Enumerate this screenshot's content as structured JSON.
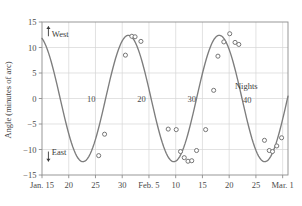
{
  "chart_data": {
    "type": "line",
    "title": "",
    "subtitle": "",
    "xlabel": "",
    "ylabel": "Angle (minutes of arc)",
    "ylim": [
      -15,
      15
    ],
    "ytick_values": [
      15,
      10,
      5,
      0,
      -5,
      -10,
      -15
    ],
    "ytick_labels": [
      "15",
      "10",
      "5",
      "0",
      "−5",
      "−10",
      "−15"
    ],
    "grid": true,
    "grid_color": "#d6d6d6",
    "legend": "none",
    "xlim_days": [
      0,
      46
    ],
    "xtick_days": [
      0,
      5,
      10,
      15,
      20,
      25,
      30,
      35,
      40,
      45
    ],
    "xtick_labels": [
      "Jan. 15",
      "20",
      "25",
      "30",
      "Feb. 5",
      "10",
      "15",
      "20",
      "25",
      "Mar. 1"
    ],
    "annotations": [
      {
        "text": "West",
        "x_day": 1.2,
        "y": 12.4,
        "arrow": "up"
      },
      {
        "text": "East",
        "x_day": 1.2,
        "y": -10.6,
        "arrow": "down"
      },
      {
        "text": "Nights",
        "x_day": 38.2,
        "y": 1.9,
        "arrow": "none"
      },
      {
        "text": "10",
        "x_day": 9.2,
        "y": -0.6,
        "arrow": "none"
      },
      {
        "text": "20",
        "x_day": 18.6,
        "y": -0.6,
        "arrow": "none"
      },
      {
        "text": "30",
        "x_day": 28.0,
        "y": -0.6,
        "arrow": "none"
      },
      {
        "text": "40",
        "x_day": 38.4,
        "y": -0.9,
        "arrow": "none"
      }
    ],
    "series": [
      {
        "name": "fitted sinusoid",
        "style": "line",
        "color": "#7d7d7d",
        "amplitude": 12.4,
        "period_days": 17.0,
        "phase_zero_rising_day": 11.9,
        "offset": 0.0
      },
      {
        "name": "observations",
        "style": "markers",
        "marker": "open-circle",
        "color": "#6f6f6f",
        "points": [
          {
            "x_day": 10.6,
            "y": -11.2
          },
          {
            "x_day": 11.7,
            "y": -7.0
          },
          {
            "x_day": 15.6,
            "y": 8.5
          },
          {
            "x_day": 16.8,
            "y": 12.2
          },
          {
            "x_day": 17.4,
            "y": 12.1
          },
          {
            "x_day": 18.5,
            "y": 11.2
          },
          {
            "x_day": 23.6,
            "y": -6.0
          },
          {
            "x_day": 25.1,
            "y": -6.1
          },
          {
            "x_day": 25.9,
            "y": -10.4
          },
          {
            "x_day": 26.6,
            "y": -11.6
          },
          {
            "x_day": 27.3,
            "y": -12.3
          },
          {
            "x_day": 28.0,
            "y": -12.2
          },
          {
            "x_day": 28.9,
            "y": -10.2
          },
          {
            "x_day": 30.6,
            "y": -6.1
          },
          {
            "x_day": 32.1,
            "y": 1.6
          },
          {
            "x_day": 32.9,
            "y": 8.3
          },
          {
            "x_day": 34.0,
            "y": 11.1
          },
          {
            "x_day": 35.1,
            "y": 12.7
          },
          {
            "x_day": 36.1,
            "y": 11.0
          },
          {
            "x_day": 36.8,
            "y": 10.6
          },
          {
            "x_day": 41.6,
            "y": -8.2
          },
          {
            "x_day": 42.5,
            "y": -10.2
          },
          {
            "x_day": 43.1,
            "y": -10.4
          },
          {
            "x_day": 43.9,
            "y": -9.3
          },
          {
            "x_day": 44.8,
            "y": -7.7
          }
        ]
      }
    ]
  }
}
